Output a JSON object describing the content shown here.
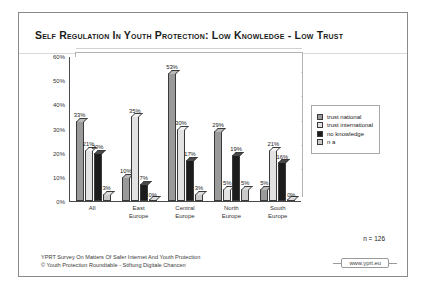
{
  "slide": {
    "title": "Self Regulation In Youth Protection: Low Knowledge - Low Trust",
    "sample_note": "n = 126",
    "footer_line1": "YPRT Survey On Matters Of Safer Internet And Youth Protection",
    "footer_line2": "© Youth Protection Roundtable - Stiftung Digitale Chancen",
    "url_badge": "www.yprt.eu"
  },
  "chart_data": {
    "type": "bar",
    "title": "Self Regulation In Youth Protection: Low Knowledge - Low Trust",
    "xlabel": "",
    "ylabel": "",
    "ylim": [
      0,
      60
    ],
    "grid": true,
    "legend_position": "right",
    "yticks": [
      "0%",
      "10%",
      "20%",
      "30%",
      "40%",
      "50%",
      "60%"
    ],
    "ytick_values": [
      0,
      10,
      20,
      30,
      40,
      50,
      60
    ],
    "categories": [
      "All",
      "East Europe",
      "Central Europe",
      "North Europe",
      "South Europe"
    ],
    "category_lines": [
      [
        "All",
        ""
      ],
      [
        "East",
        "Europe"
      ],
      [
        "Central",
        "Europe"
      ],
      [
        "North",
        "Europe"
      ],
      [
        "South",
        "Europe"
      ]
    ],
    "series": [
      {
        "name": "trust national",
        "color": "#9a9a9a",
        "values": [
          33,
          10,
          53,
          29,
          5
        ],
        "labels": [
          "33%",
          "10%",
          "53%",
          "29%",
          "5%"
        ]
      },
      {
        "name": "trust international",
        "color": "#e2e2e2",
        "values": [
          21,
          35,
          30,
          5,
          21
        ],
        "labels": [
          "21%",
          "35%",
          "30%",
          "5%",
          "21%"
        ]
      },
      {
        "name": "no knowledge",
        "color": "#1c1c1c",
        "values": [
          20,
          7,
          17,
          19,
          16
        ],
        "labels": [
          "20%",
          "7%",
          "17%",
          "19%",
          "16%"
        ]
      },
      {
        "name": "n a",
        "color": "#c9c9c9",
        "values": [
          3,
          0,
          3,
          5,
          0
        ],
        "labels": [
          "3%",
          "0%",
          "3%",
          "5%",
          "0%"
        ]
      }
    ]
  }
}
